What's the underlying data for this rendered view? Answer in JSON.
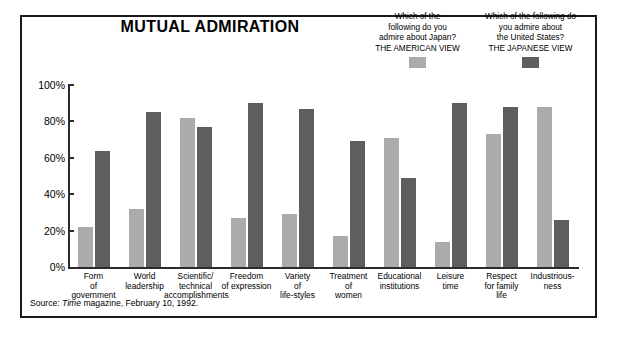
{
  "chart_data": {
    "type": "bar",
    "title": "MUTUAL ADMIRATION",
    "xlabel": "",
    "ylabel": "",
    "ylim": [
      0,
      100
    ],
    "ytick_labels": [
      "100%",
      "80%",
      "60%",
      "40%",
      "20%",
      "0%"
    ],
    "yticks": [
      100,
      80,
      60,
      40,
      20,
      0
    ],
    "grid": false,
    "legend_position": "top-right",
    "categories": [
      "Form of government",
      "World leadership",
      "Scientific/ technical accomplishments",
      "Freedom of expression",
      "Variety of life-styles",
      "Treatment of women",
      "Educational institutions",
      "Leisure time",
      "Respect for family life",
      "Industriousness"
    ],
    "category_lines": [
      [
        "Form",
        "of",
        "government"
      ],
      [
        "World",
        "leadership"
      ],
      [
        "Scientific/",
        "technical",
        "accomplishments"
      ],
      [
        "Freedom",
        "of expression"
      ],
      [
        "Variety",
        "of",
        "life-styles"
      ],
      [
        "Treatment",
        "of",
        "women"
      ],
      [
        "Educational",
        "institutions"
      ],
      [
        "Leisure",
        "time"
      ],
      [
        "Respect",
        "for family",
        "life"
      ],
      [
        "Industrious-",
        "ness"
      ]
    ],
    "series": [
      {
        "name": "THE AMERICAN VIEW",
        "color": "#ababab",
        "values": [
          22,
          32,
          82,
          27,
          29,
          17,
          71,
          14,
          73,
          88
        ]
      },
      {
        "name": "THE JAPANESE VIEW",
        "color": "#5e5e5e",
        "values": [
          64,
          85,
          77,
          90,
          87,
          69,
          49,
          90,
          88,
          26
        ]
      }
    ],
    "source": "Source: Time magazine, February 10, 1992."
  },
  "legend": {
    "american": {
      "question_lines": [
        "Which of the",
        "following do you",
        "admire about Japan?"
      ],
      "view_label": "THE AMERICAN VIEW",
      "swatch_color": "#ababab"
    },
    "japanese": {
      "question_lines": [
        "Which of the following do",
        "you admire about",
        "the United States?"
      ],
      "view_label": "THE JAPANESE VIEW",
      "swatch_color": "#5e5e5e"
    }
  },
  "source": {
    "prefix": "Source: ",
    "publication": "Time",
    "suffix": " magazine, February 10,  1992."
  }
}
